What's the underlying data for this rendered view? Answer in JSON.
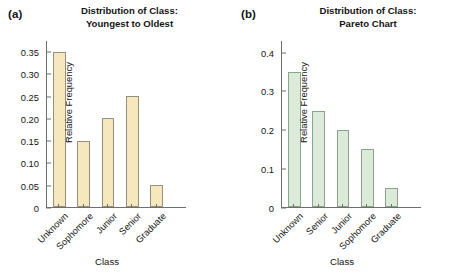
{
  "figure": {
    "panels": [
      {
        "tag": "(a)",
        "title": "Distribution of Class:\nYoungest to Oldest",
        "bar_fill": "#f7e7bd",
        "bar_stroke": "#94907f",
        "chart_data": {
          "type": "bar",
          "title": "Distribution of Class: Youngest to Oldest",
          "categories": [
            "Unknown",
            "Sophomore",
            "Junior",
            "Senior",
            "Graduate"
          ],
          "values": [
            0.35,
            0.15,
            0.2,
            0.25,
            0.05
          ],
          "xlabel": "Class",
          "ylabel": "Relative Frequency",
          "ylim": [
            0,
            0.375
          ],
          "yticks": [
            0,
            0.05,
            0.1,
            0.15,
            0.2,
            0.25,
            0.3,
            0.35
          ],
          "ytick_labels": [
            "0",
            "0.05",
            "0.10",
            "0.15",
            "0.20",
            "0.25",
            "0.30",
            "0.35"
          ],
          "grid": false,
          "legend": "none"
        }
      },
      {
        "tag": "(b)",
        "title": "Distribution of Class:\nPareto Chart",
        "bar_fill": "#dceada",
        "bar_stroke": "#8aa489",
        "chart_data": {
          "type": "bar",
          "title": "Distribution of Class: Pareto Chart",
          "categories": [
            "Unknown",
            "Senior",
            "Junior",
            "Sophomore",
            "Graduate"
          ],
          "values": [
            0.35,
            0.25,
            0.2,
            0.15,
            0.05
          ],
          "xlabel": "Class",
          "ylabel": "Relative Frequency",
          "ylim": [
            0,
            0.43
          ],
          "yticks": [
            0,
            0.1,
            0.2,
            0.3,
            0.4
          ],
          "ytick_labels": [
            "0",
            "0.1",
            "0.2",
            "0.3",
            "0.4"
          ],
          "grid": false,
          "legend": "none"
        }
      }
    ]
  },
  "chart_data": [
    {
      "type": "bar",
      "title": "Distribution of Class: Youngest to Oldest",
      "panel": "(a)",
      "categories": [
        "Unknown",
        "Sophomore",
        "Junior",
        "Senior",
        "Graduate"
      ],
      "values": [
        0.35,
        0.15,
        0.2,
        0.25,
        0.05
      ],
      "xlabel": "Class",
      "ylabel": "Relative Frequency",
      "ylim": [
        0,
        0.375
      ],
      "yticks": [
        0,
        0.05,
        0.1,
        0.15,
        0.2,
        0.25,
        0.3,
        0.35
      ],
      "grid": false,
      "legend": "none"
    },
    {
      "type": "bar",
      "title": "Distribution of Class: Pareto Chart",
      "panel": "(b)",
      "categories": [
        "Unknown",
        "Senior",
        "Junior",
        "Sophomore",
        "Graduate"
      ],
      "values": [
        0.35,
        0.25,
        0.2,
        0.15,
        0.05
      ],
      "xlabel": "Class",
      "ylabel": "Relative Frequency",
      "ylim": [
        0,
        0.43
      ],
      "yticks": [
        0,
        0.1,
        0.2,
        0.3,
        0.4
      ],
      "grid": false,
      "legend": "none"
    }
  ]
}
